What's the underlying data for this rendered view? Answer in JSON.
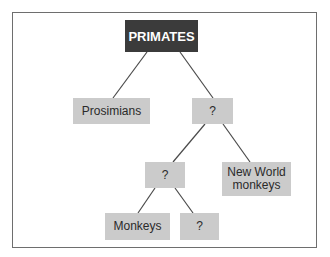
{
  "diagram": {
    "type": "tree",
    "root": {
      "id": "primates",
      "label": "PRIMATES"
    },
    "nodes": [
      {
        "id": "prosimians",
        "label": "Prosimians",
        "parent": "primates"
      },
      {
        "id": "q1",
        "label": "?",
        "parent": "primates"
      },
      {
        "id": "q2",
        "label": "?",
        "parent": "q1"
      },
      {
        "id": "new_world",
        "label": "New World monkeys",
        "line1": "New World",
        "line2": "monkeys",
        "parent": "q1"
      },
      {
        "id": "monkeys",
        "label": "Monkeys",
        "parent": "q2"
      },
      {
        "id": "q3",
        "label": "?",
        "parent": "q2"
      }
    ],
    "colors": {
      "root_fill": "#3b3b3b",
      "root_text": "#ffffff",
      "node_fill": "#cbcbcb",
      "node_text": "#2a2a2a",
      "edge": "#4a4a4a",
      "frame": "#6e6e6e"
    }
  }
}
